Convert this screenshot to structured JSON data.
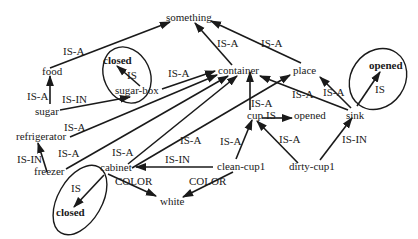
{
  "diagram": {
    "type": "semantic-network",
    "nodes": {
      "something": "something",
      "food": "food",
      "sugar": "sugar",
      "sugar_box": "sugar-box",
      "closed_sugarbox": "closed",
      "container": "container",
      "place": "place",
      "refrigerator": "refrigerator",
      "freezer": "freezer",
      "cabinet": "cabinet",
      "closed_cabinet": "closed",
      "white": "white",
      "cup": "cup",
      "opened_cup": "opened",
      "sink": "sink",
      "opened_sink": "opened",
      "clean_cup1": "clean-cup1",
      "dirty_cup1": "dirty-cup1"
    },
    "edges": [
      {
        "from": "food",
        "to": "something",
        "label": "IS-A"
      },
      {
        "from": "container",
        "to": "something",
        "label": "IS-A"
      },
      {
        "from": "place",
        "to": "something",
        "label": "IS-A"
      },
      {
        "from": "sugar",
        "to": "food",
        "label": "IS-A"
      },
      {
        "from": "sugar",
        "to": "sugar-box",
        "label": "IS-IN"
      },
      {
        "from": "sugar-box",
        "to": "closed",
        "label": "IS"
      },
      {
        "from": "sugar-box",
        "to": "container",
        "label": "IS-A"
      },
      {
        "from": "refrigerator",
        "to": "container",
        "label": "IS-A"
      },
      {
        "from": "freezer",
        "to": "refrigerator",
        "label": "IS-IN"
      },
      {
        "from": "freezer",
        "to": "container",
        "label": "IS-A"
      },
      {
        "from": "cabinet",
        "to": "container",
        "label": "IS-A"
      },
      {
        "from": "cabinet",
        "to": "place",
        "label": "IS-A"
      },
      {
        "from": "cabinet",
        "to": "closed",
        "label": "IS"
      },
      {
        "from": "cabinet",
        "to": "white",
        "label": "COLOR"
      },
      {
        "from": "cup",
        "to": "container",
        "label": "IS-A"
      },
      {
        "from": "cup",
        "to": "opened",
        "label": "IS"
      },
      {
        "from": "sink",
        "to": "container",
        "label": "IS-A"
      },
      {
        "from": "sink",
        "to": "place",
        "label": "IS-A"
      },
      {
        "from": "sink",
        "to": "opened",
        "label": "IS"
      },
      {
        "from": "clean-cup1",
        "to": "cabinet",
        "label": "IS-IN"
      },
      {
        "from": "clean-cup1",
        "to": "cup",
        "label": "IS-A"
      },
      {
        "from": "clean-cup1",
        "to": "white",
        "label": "COLOR"
      },
      {
        "from": "dirty-cup1",
        "to": "cup",
        "label": "IS-A"
      },
      {
        "from": "dirty-cup1",
        "to": "sink",
        "label": "IS-IN"
      }
    ],
    "edge_labels": {
      "food_something": "IS-A",
      "container_something": "IS-A",
      "place_something": "IS-A",
      "sugar_food": "IS-A",
      "sugar_sugarbox": "IS-IN",
      "sugarbox_closed": "IS",
      "sugarbox_container": "IS-A",
      "refrigerator_container": "IS-A",
      "freezer_refrigerator": "IS-IN",
      "freezer_container": "IS-A",
      "cabinet_container": "IS-A",
      "cabinet_place": "IS-A",
      "cabinet_closed": "IS",
      "cabinet_white": "COLOR",
      "cup_container": "IS-A",
      "cup_opened": "IS",
      "sink_container": "IS-A",
      "sink_place": "IS-A",
      "sink_opened": "IS",
      "cleancup_cabinet": "IS-IN",
      "cleancup_cup": "IS-A",
      "cleancup_white": "COLOR",
      "dirtycup_cup": "IS-A",
      "dirtycup_sink": "IS-IN"
    },
    "colors": {
      "ink": "#1a1a1a",
      "background": "#ffffff"
    }
  }
}
